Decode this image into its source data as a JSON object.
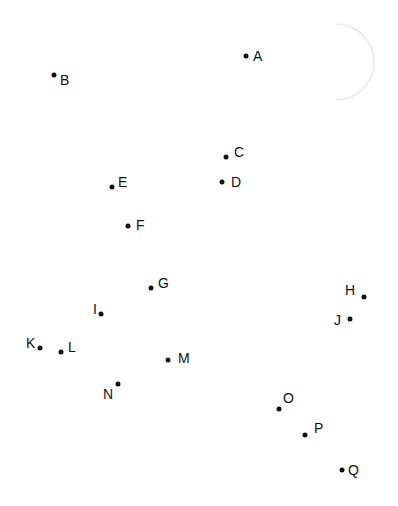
{
  "diagram": {
    "width": 398,
    "height": 506,
    "background": "#ffffff",
    "dot_color": "#111111",
    "arc": {
      "stroke": "#e8e8e8",
      "cx": 342,
      "cy": 62,
      "r": 38
    },
    "points": [
      {
        "label": "A",
        "x": 246,
        "y": 56,
        "lx": 253,
        "ly": 49
      },
      {
        "label": "B",
        "x": 54,
        "y": 75,
        "lx": 60,
        "ly": 73
      },
      {
        "label": "C",
        "x": 226,
        "y": 157,
        "lx": 234,
        "ly": 145
      },
      {
        "label": "D",
        "x": 222,
        "y": 182,
        "lx": 231,
        "ly": 175
      },
      {
        "label": "E",
        "x": 112,
        "y": 187,
        "lx": 118,
        "ly": 175
      },
      {
        "label": "F",
        "x": 128,
        "y": 226,
        "lx": 136,
        "ly": 218
      },
      {
        "label": "G",
        "x": 151,
        "y": 288,
        "lx": 158,
        "ly": 276
      },
      {
        "label": "H",
        "x": 364,
        "y": 297,
        "lx": 345,
        "ly": 283
      },
      {
        "label": "I",
        "x": 101,
        "y": 314,
        "lx": 93,
        "ly": 302
      },
      {
        "label": "J",
        "x": 350,
        "y": 319,
        "lx": 334,
        "ly": 313
      },
      {
        "label": "K",
        "x": 40,
        "y": 348,
        "lx": 26,
        "ly": 336
      },
      {
        "label": "L",
        "x": 61,
        "y": 352,
        "lx": 68,
        "ly": 340
      },
      {
        "label": "M",
        "x": 168,
        "y": 360,
        "lx": 178,
        "ly": 351
      },
      {
        "label": "N",
        "x": 118,
        "y": 384,
        "lx": 103,
        "ly": 387
      },
      {
        "label": "O",
        "x": 279,
        "y": 409,
        "lx": 283,
        "ly": 391
      },
      {
        "label": "P",
        "x": 305,
        "y": 435,
        "lx": 314,
        "ly": 421
      },
      {
        "label": "Q",
        "x": 342,
        "y": 470,
        "lx": 348,
        "ly": 463
      }
    ]
  }
}
